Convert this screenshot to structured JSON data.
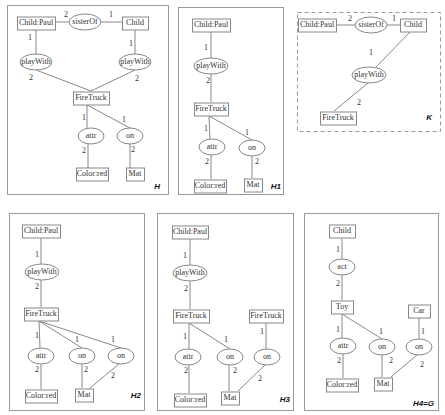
{
  "panels": [
    {
      "id": "H",
      "title": "H",
      "dashed": false,
      "box": [
        7,
        5,
        161,
        189
      ],
      "concepts": [
        {
          "id": "c1",
          "label": "Child:Paul",
          "x": 36,
          "y": 23,
          "w": 38,
          "h": 13
        },
        {
          "id": "c2",
          "label": "Child",
          "x": 135,
          "y": 23,
          "w": 26,
          "h": 13
        },
        {
          "id": "c3",
          "label": "FireTruck",
          "x": 91,
          "y": 98,
          "w": 36,
          "h": 13
        },
        {
          "id": "c4",
          "label": "Color:red",
          "x": 92,
          "y": 174,
          "w": 32,
          "h": 13
        },
        {
          "id": "c5",
          "label": "Mat",
          "x": 135,
          "y": 174,
          "w": 18,
          "h": 13
        }
      ],
      "relations": [
        {
          "id": "r1",
          "label": "sisterOf",
          "x": 85,
          "y": 22,
          "rx": 16,
          "ry": 8
        },
        {
          "id": "r2",
          "label": "playWith",
          "x": 36,
          "y": 62,
          "rx": 16,
          "ry": 8
        },
        {
          "id": "r3",
          "label": "playWith",
          "x": 135,
          "y": 62,
          "rx": 16,
          "ry": 8
        },
        {
          "id": "r4",
          "label": "attr",
          "x": 91,
          "y": 136,
          "rx": 13,
          "ry": 8
        },
        {
          "id": "r5",
          "label": "on",
          "x": 130,
          "y": 136,
          "rx": 13,
          "ry": 8
        }
      ],
      "edges": [
        {
          "from": [
            55,
            22
          ],
          "to": [
            69,
            22
          ],
          "label": "2",
          "lx": 66,
          "ly": 15
        },
        {
          "from": [
            101,
            22
          ],
          "to": [
            122,
            22
          ],
          "label": "1",
          "lx": 111,
          "ly": 15
        },
        {
          "from": [
            36,
            30
          ],
          "to": [
            36,
            54
          ],
          "label": "1",
          "lx": 30,
          "ly": 38
        },
        {
          "from": [
            135,
            30
          ],
          "to": [
            135,
            54
          ],
          "label": "1",
          "lx": 131,
          "ly": 44
        },
        {
          "from": [
            36,
            70
          ],
          "to": [
            91,
            91
          ],
          "label": "2",
          "lx": 31,
          "ly": 78
        },
        {
          "from": [
            135,
            70
          ],
          "to": [
            91,
            91
          ],
          "label": "2",
          "lx": 137,
          "ly": 79
        },
        {
          "from": [
            87,
            105
          ],
          "to": [
            87,
            128
          ],
          "label": "1",
          "lx": 84,
          "ly": 118
        },
        {
          "from": [
            87,
            105
          ],
          "to": [
            130,
            128
          ],
          "label": "1",
          "lx": 124,
          "ly": 120
        },
        {
          "from": [
            88,
            144
          ],
          "to": [
            88,
            168
          ],
          "label": "2",
          "lx": 84,
          "ly": 151
        },
        {
          "from": [
            130,
            144
          ],
          "to": [
            130,
            168
          ],
          "label": "2",
          "lx": 133,
          "ly": 150
        }
      ],
      "title_pos": [
        160,
        187
      ]
    },
    {
      "id": "H1",
      "title": "H1",
      "dashed": false,
      "box": [
        178,
        7,
        105,
        187
      ],
      "concepts": [
        {
          "id": "c1",
          "label": "Child:Paul",
          "x": 211,
          "y": 25,
          "w": 38,
          "h": 13
        },
        {
          "id": "c2",
          "label": "FireTruck",
          "x": 211,
          "y": 109,
          "w": 34,
          "h": 13
        },
        {
          "id": "c3",
          "label": "Color:red",
          "x": 210,
          "y": 186,
          "w": 32,
          "h": 13
        },
        {
          "id": "c4",
          "label": "Mat",
          "x": 253,
          "y": 185,
          "w": 18,
          "h": 13
        }
      ],
      "relations": [
        {
          "id": "r1",
          "label": "playWith",
          "x": 211,
          "y": 66,
          "rx": 17,
          "ry": 8
        },
        {
          "id": "r2",
          "label": "attr",
          "x": 212,
          "y": 147,
          "rx": 13,
          "ry": 8
        },
        {
          "id": "r3",
          "label": "on",
          "x": 252,
          "y": 148,
          "rx": 13,
          "ry": 8
        }
      ],
      "edges": [
        {
          "from": [
            211,
            32
          ],
          "to": [
            211,
            58
          ],
          "label": "1",
          "lx": 206,
          "ly": 48
        },
        {
          "from": [
            211,
            74
          ],
          "to": [
            211,
            102
          ],
          "label": "2",
          "lx": 208,
          "ly": 81
        },
        {
          "from": [
            209,
            116
          ],
          "to": [
            210,
            139
          ],
          "label": "1",
          "lx": 206,
          "ly": 129
        },
        {
          "from": [
            209,
            116
          ],
          "to": [
            252,
            140
          ],
          "label": "1",
          "lx": 247,
          "ly": 133
        },
        {
          "from": [
            211,
            155
          ],
          "to": [
            211,
            179
          ],
          "label": "2",
          "lx": 207,
          "ly": 162
        },
        {
          "from": [
            252,
            156
          ],
          "to": [
            252,
            178
          ],
          "label": "2",
          "lx": 257,
          "ly": 162
        }
      ],
      "title_pos": [
        281,
        187
      ]
    },
    {
      "id": "K",
      "title": "K",
      "dashed": true,
      "box": [
        297,
        12,
        143,
        119
      ],
      "concepts": [
        {
          "id": "c1",
          "label": "Child:Paul",
          "x": 317,
          "y": 25,
          "w": 38,
          "h": 13
        },
        {
          "id": "c2",
          "label": "Child",
          "x": 413,
          "y": 25,
          "w": 26,
          "h": 13
        }
      ],
      "relations": [
        {
          "id": "r1",
          "label": "sisterOf",
          "x": 371,
          "y": 25,
          "rx": 16,
          "ry": 8
        },
        {
          "id": "r2",
          "label": "playWith",
          "x": 369,
          "y": 75,
          "rx": 17,
          "ry": 8
        }
      ],
      "extra_concepts": [
        {
          "id": "c3",
          "label": "FireTruck",
          "x": 338,
          "y": 118,
          "w": 36,
          "h": 13
        }
      ],
      "edges": [
        {
          "from": [
            336,
            25
          ],
          "to": [
            355,
            25
          ],
          "label": "2",
          "lx": 350,
          "ly": 19
        },
        {
          "from": [
            387,
            25
          ],
          "to": [
            400,
            25
          ],
          "label": "1",
          "lx": 394,
          "ly": 19
        },
        {
          "from": [
            410,
            32
          ],
          "to": [
            376,
            67
          ],
          "label": "1",
          "lx": 371,
          "ly": 53
        },
        {
          "from": [
            368,
            83
          ],
          "to": [
            334,
            111
          ],
          "label": "2",
          "lx": 359,
          "ly": 103
        }
      ],
      "title_pos": [
        432,
        118
      ]
    },
    {
      "id": "H2",
      "title": "H2",
      "dashed": false,
      "box": [
        9,
        213,
        135,
        197
      ],
      "concepts": [
        {
          "id": "c1",
          "label": "Child:Paul",
          "x": 41,
          "y": 231,
          "w": 38,
          "h": 13
        },
        {
          "id": "c2",
          "label": "FireTruck",
          "x": 41,
          "y": 314,
          "w": 34,
          "h": 13
        },
        {
          "id": "c3",
          "label": "Color:red",
          "x": 41,
          "y": 396,
          "w": 32,
          "h": 13
        },
        {
          "id": "c4",
          "label": "Mat",
          "x": 84,
          "y": 395,
          "w": 18,
          "h": 13
        }
      ],
      "relations": [
        {
          "id": "r1",
          "label": "playWith",
          "x": 42,
          "y": 272,
          "rx": 17,
          "ry": 8
        },
        {
          "id": "r2",
          "label": "attr",
          "x": 41,
          "y": 356,
          "rx": 13,
          "ry": 8
        },
        {
          "id": "r3",
          "label": "on",
          "x": 82,
          "y": 356,
          "rx": 13,
          "ry": 8
        },
        {
          "id": "r4",
          "label": "on",
          "x": 121,
          "y": 356,
          "rx": 13,
          "ry": 8
        }
      ],
      "edges": [
        {
          "from": [
            41,
            238
          ],
          "to": [
            41,
            264
          ],
          "label": "1",
          "lx": 37,
          "ly": 255
        },
        {
          "from": [
            41,
            280
          ],
          "to": [
            41,
            307
          ],
          "label": "2",
          "lx": 37,
          "ly": 287
        },
        {
          "from": [
            39,
            321
          ],
          "to": [
            40,
            348
          ],
          "label": "1",
          "lx": 37,
          "ly": 336
        },
        {
          "from": [
            39,
            321
          ],
          "to": [
            82,
            348
          ],
          "label": "1",
          "lx": 77,
          "ly": 340
        },
        {
          "from": [
            39,
            321
          ],
          "to": [
            121,
            348
          ],
          "label": "1",
          "lx": 113,
          "ly": 340
        },
        {
          "from": [
            41,
            364
          ],
          "to": [
            41,
            389
          ],
          "label": "2",
          "lx": 37,
          "ly": 370
        },
        {
          "from": [
            82,
            364
          ],
          "to": [
            82,
            388
          ],
          "label": "2",
          "lx": 86,
          "ly": 370
        },
        {
          "from": [
            119,
            364
          ],
          "to": [
            90,
            388
          ],
          "label": "2",
          "lx": 113,
          "ly": 376
        }
      ],
      "title_pos": [
        141,
        396
      ]
    },
    {
      "id": "H3",
      "title": "H3",
      "dashed": false,
      "box": [
        157,
        213,
        136,
        197
      ],
      "concepts": [
        {
          "id": "c1",
          "label": "Child:Paul",
          "x": 190,
          "y": 232,
          "w": 36,
          "h": 13
        },
        {
          "id": "c2",
          "label": "FireTruck",
          "x": 191,
          "y": 316,
          "w": 36,
          "h": 13
        },
        {
          "id": "c3",
          "label": "FireTruck",
          "x": 266,
          "y": 316,
          "w": 34,
          "h": 13
        },
        {
          "id": "c4",
          "label": "Color:red",
          "x": 190,
          "y": 400,
          "w": 32,
          "h": 13
        },
        {
          "id": "c5",
          "label": "Mat",
          "x": 230,
          "y": 398,
          "w": 18,
          "h": 13
        }
      ],
      "relations": [
        {
          "id": "r1",
          "label": "playWith",
          "x": 190,
          "y": 273,
          "rx": 17,
          "ry": 8
        },
        {
          "id": "r2",
          "label": "attr",
          "x": 188,
          "y": 357,
          "rx": 13,
          "ry": 8
        },
        {
          "id": "r3",
          "label": "on",
          "x": 230,
          "y": 357,
          "rx": 13,
          "ry": 8
        },
        {
          "id": "r4",
          "label": "on",
          "x": 267,
          "y": 357,
          "rx": 13,
          "ry": 8
        }
      ],
      "edges": [
        {
          "from": [
            190,
            239
          ],
          "to": [
            190,
            265
          ],
          "label": "1",
          "lx": 185,
          "ly": 256
        },
        {
          "from": [
            190,
            281
          ],
          "to": [
            190,
            309
          ],
          "label": "2",
          "lx": 186,
          "ly": 289
        },
        {
          "from": [
            189,
            323
          ],
          "to": [
            189,
            349
          ],
          "label": "1",
          "lx": 185,
          "ly": 337
        },
        {
          "from": [
            189,
            323
          ],
          "to": [
            230,
            349
          ],
          "label": "1",
          "lx": 226,
          "ly": 340
        },
        {
          "from": [
            266,
            323
          ],
          "to": [
            266,
            349
          ],
          "label": "1",
          "lx": 262,
          "ly": 332
        },
        {
          "from": [
            189,
            365
          ],
          "to": [
            189,
            393
          ],
          "label": "2",
          "lx": 186,
          "ly": 371
        },
        {
          "from": [
            229,
            365
          ],
          "to": [
            229,
            391
          ],
          "label": "2",
          "lx": 235,
          "ly": 371
        },
        {
          "from": [
            265,
            365
          ],
          "to": [
            238,
            391
          ],
          "label": "2",
          "lx": 260,
          "ly": 379
        }
      ],
      "title_pos": [
        290,
        400
      ]
    },
    {
      "id": "H4",
      "title": "H4=G",
      "dashed": false,
      "box": [
        304,
        213,
        134,
        197
      ],
      "concepts": [
        {
          "id": "c1",
          "label": "Child",
          "x": 342,
          "y": 231,
          "w": 26,
          "h": 13
        },
        {
          "id": "c2",
          "label": "Toy",
          "x": 342,
          "y": 307,
          "w": 22,
          "h": 13
        },
        {
          "id": "c3",
          "label": "Car",
          "x": 419,
          "y": 311,
          "w": 22,
          "h": 13
        },
        {
          "id": "c4",
          "label": "Color:red",
          "x": 342,
          "y": 385,
          "w": 32,
          "h": 13
        },
        {
          "id": "c5",
          "label": "Mat",
          "x": 383,
          "y": 384,
          "w": 18,
          "h": 13
        }
      ],
      "relations": [
        {
          "id": "r1",
          "label": "act",
          "x": 342,
          "y": 267,
          "rx": 13,
          "ry": 8
        },
        {
          "id": "r2",
          "label": "attr",
          "x": 343,
          "y": 346,
          "rx": 13,
          "ry": 8
        },
        {
          "id": "r3",
          "label": "on",
          "x": 382,
          "y": 347,
          "rx": 13,
          "ry": 8
        },
        {
          "id": "r4",
          "label": "on",
          "x": 419,
          "y": 347,
          "rx": 13,
          "ry": 8
        }
      ],
      "edges": [
        {
          "from": [
            342,
            238
          ],
          "to": [
            342,
            259
          ],
          "label": "1",
          "lx": 338,
          "ly": 250
        },
        {
          "from": [
            342,
            275
          ],
          "to": [
            342,
            300
          ],
          "label": "2",
          "lx": 338,
          "ly": 284
        },
        {
          "from": [
            342,
            314
          ],
          "to": [
            342,
            338
          ],
          "label": "1",
          "lx": 338,
          "ly": 330
        },
        {
          "from": [
            342,
            314
          ],
          "to": [
            382,
            339
          ],
          "label": "1",
          "lx": 381,
          "ly": 332
        },
        {
          "from": [
            419,
            318
          ],
          "to": [
            419,
            339
          ],
          "label": "1",
          "lx": 423,
          "ly": 332
        },
        {
          "from": [
            343,
            354
          ],
          "to": [
            343,
            378
          ],
          "label": "2",
          "lx": 339,
          "ly": 361
        },
        {
          "from": [
            382,
            355
          ],
          "to": [
            382,
            377
          ],
          "label": "2",
          "lx": 391,
          "ly": 361
        },
        {
          "from": [
            417,
            355
          ],
          "to": [
            391,
            377
          ],
          "label": "2",
          "lx": 422,
          "ly": 365
        }
      ],
      "title_pos": [
        434,
        404
      ]
    }
  ]
}
